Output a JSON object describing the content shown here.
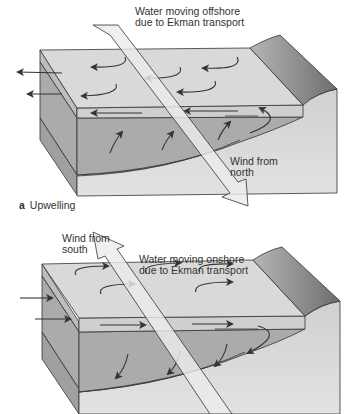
{
  "panels": [
    {
      "id": "a",
      "caption_letter": "a",
      "caption_text": "Upwelling",
      "water_label_line1": "Water moving offshore",
      "water_label_line2": "due to Ekman transport",
      "wind_label_line1": "Wind from",
      "wind_label_line2": "north",
      "wind_direction": "toward-south",
      "surface_flow": "offshore",
      "deep_flow": "upward"
    },
    {
      "id": "b",
      "caption_letter": "b",
      "caption_text": "Downwelling",
      "water_label_line1": "Water moving onshore",
      "water_label_line2": "due to Ekman transport",
      "wind_label_line1": "Wind from",
      "wind_label_line2": "south",
      "wind_direction": "toward-north",
      "surface_flow": "onshore",
      "deep_flow": "downward"
    }
  ],
  "colors": {
    "top_surface": "#d9d9d9",
    "surface_layer_front": "#cfcfcf",
    "deep_layer_front": "#ababab",
    "bottom_layer_front": "#c4c4c4",
    "left_face_upper": "#b3b3b3",
    "left_face_lower": "#a5a5a5",
    "shore_slope": "#8f8f8f",
    "land_face": "#d6d6d6",
    "wind_arrow": "#ebebeb",
    "outline": "#333333"
  }
}
